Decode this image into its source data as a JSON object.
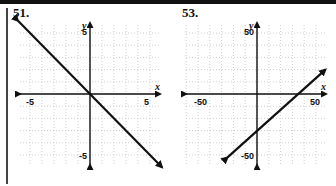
{
  "problems": [
    {
      "number": "51."
    },
    {
      "number": "53."
    }
  ],
  "chart_data": [
    {
      "type": "line",
      "title": "51.",
      "xlabel": "x",
      "ylabel": "y",
      "xlim": [
        -5,
        5
      ],
      "ylim": [
        -5,
        5
      ],
      "grid": true,
      "tick_labels": {
        "x_min": "-5",
        "x_max": "5",
        "y_min": "-5",
        "y_max": "5"
      },
      "series": [
        {
          "name": "line",
          "x": [
            -6,
            6
          ],
          "y": [
            6,
            -6
          ],
          "equation": "y = -x",
          "arrows": "both"
        }
      ]
    },
    {
      "type": "line",
      "title": "53.",
      "xlabel": "x",
      "ylabel": "y",
      "xlim": [
        -50,
        50
      ],
      "ylim": [
        -50,
        50
      ],
      "grid": true,
      "tick_labels": {
        "x_min": "-50",
        "x_max": "50",
        "y_min": "-50",
        "y_max": "50"
      },
      "series": [
        {
          "name": "line",
          "x": [
            -25,
            58
          ],
          "y": [
            -52,
            20
          ],
          "x_intercept": 35,
          "y_intercept": -30,
          "arrows": "both"
        }
      ]
    }
  ]
}
